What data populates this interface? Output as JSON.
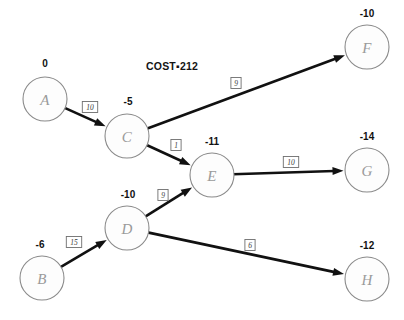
{
  "diagram": {
    "title_annotation": "COST▪212",
    "annotation_x": 146,
    "annotation_y": 60,
    "width": 404,
    "height": 320,
    "node_radius": 22,
    "colors": {
      "background": "#ffffff",
      "node_stroke": "#8a8a8a",
      "node_fill": "#fdfdfd",
      "node_letter": "#9a9a9a",
      "node_value": "#111111",
      "edge": "#111111",
      "label_box_stroke": "#6e6e6e",
      "label_text": "#3a3a3a"
    },
    "nodes": [
      {
        "id": "A",
        "label": "A",
        "value": "0",
        "cx": 45,
        "cy": 99,
        "value_x": 45,
        "value_y": 67
      },
      {
        "id": "B",
        "label": "B",
        "value": "-6",
        "cx": 42,
        "cy": 278,
        "value_x": 40,
        "value_y": 248
      },
      {
        "id": "C",
        "label": "C",
        "value": "-5",
        "cx": 127,
        "cy": 136,
        "value_x": 128,
        "value_y": 105
      },
      {
        "id": "D",
        "label": "D",
        "value": "-10",
        "cx": 127,
        "cy": 228,
        "value_x": 128,
        "value_y": 198
      },
      {
        "id": "E",
        "label": "E",
        "value": "-11",
        "cx": 212,
        "cy": 175,
        "value_x": 212,
        "value_y": 145
      },
      {
        "id": "F",
        "label": "F",
        "value": "-10",
        "cx": 367,
        "cy": 47,
        "value_x": 367,
        "value_y": 17
      },
      {
        "id": "G",
        "label": "G",
        "value": "-14",
        "cx": 367,
        "cy": 170,
        "value_x": 367,
        "value_y": 140
      },
      {
        "id": "H",
        "label": "H",
        "value": "-12",
        "cx": 367,
        "cy": 279,
        "value_x": 367,
        "value_y": 249
      }
    ],
    "edges": [
      {
        "id": "A-C",
        "from": "A",
        "to": "C",
        "cost": "10",
        "label_x": 90,
        "label_y": 107
      },
      {
        "id": "C-F",
        "from": "C",
        "to": "F",
        "cost": "9",
        "label_x": 236,
        "label_y": 83
      },
      {
        "id": "C-E",
        "from": "C",
        "to": "E",
        "cost": "1",
        "label_x": 176,
        "label_y": 145
      },
      {
        "id": "E-G",
        "from": "E",
        "to": "G",
        "cost": "10",
        "label_x": 291,
        "label_y": 162
      },
      {
        "id": "D-E",
        "from": "D",
        "to": "E",
        "cost": "9",
        "label_x": 163,
        "label_y": 195
      },
      {
        "id": "B-D",
        "from": "B",
        "to": "D",
        "cost": "15",
        "label_x": 74,
        "label_y": 242
      },
      {
        "id": "D-H",
        "from": "D",
        "to": "H",
        "cost": "6",
        "label_x": 250,
        "label_y": 245
      }
    ]
  },
  "chart_data": {
    "type": "diagram",
    "node_ids": [
      "A",
      "B",
      "C",
      "D",
      "E",
      "F",
      "G",
      "H"
    ],
    "node_values": [
      0,
      -6,
      -5,
      -10,
      -11,
      -10,
      -14,
      -12
    ],
    "edges": [
      {
        "from": "A",
        "to": "C",
        "cost": 10
      },
      {
        "from": "C",
        "to": "F",
        "cost": 9
      },
      {
        "from": "C",
        "to": "E",
        "cost": 1
      },
      {
        "from": "E",
        "to": "G",
        "cost": 10
      },
      {
        "from": "D",
        "to": "E",
        "cost": 9
      },
      {
        "from": "B",
        "to": "D",
        "cost": 15
      },
      {
        "from": "D",
        "to": "H",
        "cost": 6
      }
    ],
    "total_cost": 212
  }
}
